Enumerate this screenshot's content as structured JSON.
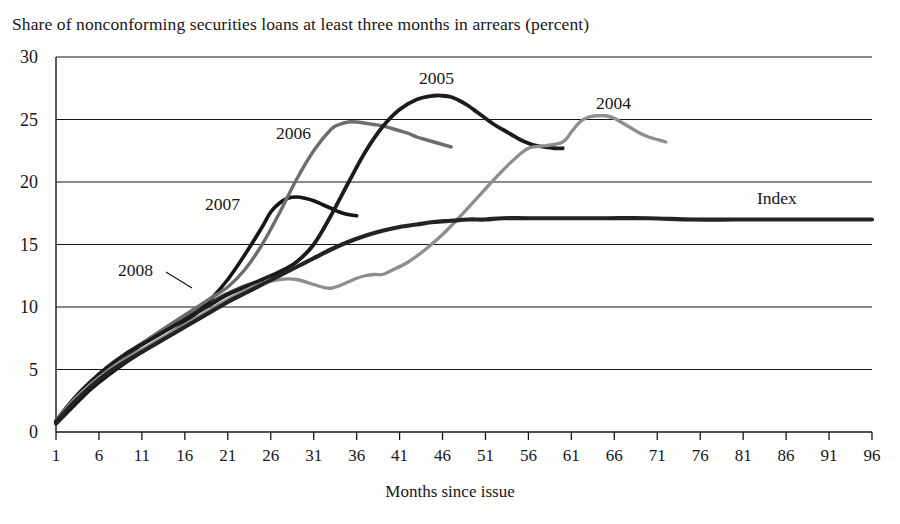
{
  "chart_data": {
    "type": "line",
    "title": "Share of nonconforming securities loans at least three months in arrears (percent)",
    "xlabel": "Months since issue",
    "ylabel": "",
    "xlim": [
      1,
      96
    ],
    "ylim": [
      0,
      30
    ],
    "yticks": [
      0,
      5,
      10,
      15,
      20,
      25,
      30
    ],
    "xticks": [
      1,
      6,
      11,
      16,
      21,
      26,
      31,
      36,
      41,
      46,
      51,
      56,
      61,
      66,
      71,
      76,
      81,
      86,
      91,
      96
    ],
    "grid": "horizontal",
    "legend": "inline-labels",
    "series": [
      {
        "name": "2008",
        "label": "2008",
        "color": "#4a4a4a",
        "width": 3.2,
        "label_x": 118,
        "label_y": 262,
        "leader": {
          "x1": 166,
          "y1": 272,
          "x2": 192,
          "y2": 288
        },
        "x": [
          1,
          3,
          5,
          7,
          9,
          11,
          13,
          15,
          17,
          19,
          21,
          23,
          25
        ],
        "y": [
          0.6,
          2.0,
          3.4,
          4.7,
          5.9,
          7.0,
          8.0,
          8.9,
          9.7,
          10.4,
          11.1,
          11.7,
          12.1
        ]
      },
      {
        "name": "2007",
        "label": "2007",
        "color": "#151515",
        "width": 3.6,
        "label_x": 205,
        "label_y": 196,
        "x": [
          1,
          3,
          5,
          7,
          9,
          11,
          13,
          15,
          17,
          19,
          21,
          23,
          25,
          26,
          27,
          28,
          29,
          30,
          31,
          32,
          33,
          34,
          35,
          36
        ],
        "y": [
          0.7,
          2.1,
          3.4,
          4.5,
          5.5,
          6.4,
          7.3,
          8.2,
          9.3,
          10.6,
          12.2,
          14.2,
          16.4,
          17.6,
          18.3,
          18.7,
          18.8,
          18.7,
          18.5,
          18.2,
          17.9,
          17.6,
          17.4,
          17.3
        ]
      },
      {
        "name": "2006",
        "label": "2006",
        "color": "#6d6d6d",
        "width": 3.4,
        "label_x": 276,
        "label_y": 125,
        "x": [
          1,
          3,
          5,
          7,
          9,
          11,
          13,
          15,
          17,
          19,
          21,
          23,
          25,
          27,
          29,
          31,
          33,
          34,
          35,
          36,
          37,
          38,
          39,
          40,
          41,
          42,
          43,
          44,
          45,
          46,
          47
        ],
        "y": [
          0.8,
          2.4,
          3.9,
          5.1,
          6.2,
          7.1,
          8.0,
          8.9,
          9.8,
          10.7,
          11.6,
          13.0,
          15.0,
          17.5,
          20.2,
          22.5,
          24.2,
          24.6,
          24.8,
          24.8,
          24.7,
          24.6,
          24.5,
          24.3,
          24.1,
          23.9,
          23.6,
          23.4,
          23.2,
          23.0,
          22.8
        ]
      },
      {
        "name": "2005",
        "label": "2005",
        "color": "#1c1c1c",
        "width": 3.8,
        "label_x": 419,
        "label_y": 70,
        "x": [
          1,
          3,
          5,
          7,
          9,
          11,
          13,
          15,
          17,
          19,
          21,
          23,
          25,
          27,
          29,
          31,
          33,
          35,
          37,
          39,
          41,
          43,
          45,
          46,
          47,
          48,
          49,
          50,
          51,
          52,
          53,
          54,
          55,
          56,
          57,
          58,
          59,
          60
        ],
        "y": [
          0.9,
          2.6,
          4.0,
          5.2,
          6.2,
          7.0,
          7.8,
          8.6,
          9.4,
          10.2,
          11.0,
          11.6,
          12.2,
          12.8,
          13.6,
          15.0,
          17.3,
          19.9,
          22.4,
          24.4,
          25.8,
          26.6,
          26.9,
          26.9,
          26.8,
          26.5,
          26.1,
          25.6,
          25.1,
          24.6,
          24.2,
          23.8,
          23.4,
          23.1,
          22.9,
          22.8,
          22.7,
          22.7
        ]
      },
      {
        "name": "2004",
        "label": "2004",
        "color": "#8e8e8e",
        "width": 3.3,
        "label_x": 596,
        "label_y": 95,
        "x": [
          1,
          3,
          5,
          7,
          9,
          11,
          13,
          15,
          17,
          19,
          21,
          23,
          25,
          27,
          29,
          31,
          32,
          33,
          34,
          35,
          36,
          37,
          38,
          39,
          40,
          42,
          44,
          46,
          48,
          50,
          52,
          54,
          56,
          58,
          60,
          61,
          62,
          63,
          64,
          65,
          66,
          67,
          68,
          69,
          70,
          71,
          72
        ],
        "y": [
          0.9,
          2.5,
          3.8,
          4.9,
          5.8,
          6.6,
          7.4,
          8.2,
          9.0,
          9.8,
          10.6,
          11.3,
          11.9,
          12.2,
          12.2,
          11.8,
          11.6,
          11.5,
          11.7,
          12.0,
          12.3,
          12.5,
          12.6,
          12.6,
          12.9,
          13.6,
          14.6,
          15.8,
          17.2,
          18.7,
          20.2,
          21.6,
          22.7,
          22.9,
          23.2,
          24.0,
          24.8,
          25.2,
          25.3,
          25.3,
          25.1,
          24.7,
          24.3,
          23.9,
          23.6,
          23.4,
          23.2
        ]
      },
      {
        "name": "Index",
        "label": "Index",
        "color": "#232323",
        "width": 4.2,
        "label_x": 757,
        "label_y": 190,
        "x": [
          1,
          3,
          5,
          7,
          9,
          11,
          13,
          15,
          17,
          19,
          21,
          23,
          25,
          27,
          29,
          31,
          33,
          35,
          37,
          39,
          41,
          43,
          45,
          47,
          49,
          51,
          53,
          56,
          60,
          65,
          70,
          75,
          80,
          85,
          90,
          96
        ],
        "y": [
          0.8,
          2.3,
          3.6,
          4.7,
          5.6,
          6.4,
          7.2,
          8.0,
          8.8,
          9.6,
          10.4,
          11.1,
          11.8,
          12.5,
          13.2,
          13.9,
          14.6,
          15.2,
          15.7,
          16.1,
          16.4,
          16.6,
          16.8,
          16.9,
          17.0,
          17.0,
          17.1,
          17.1,
          17.1,
          17.1,
          17.1,
          17.0,
          17.0,
          17.0,
          17.0,
          17.0
        ]
      }
    ]
  },
  "axes": {
    "ytick_labels": [
      "30",
      "25",
      "20",
      "15",
      "10",
      "5",
      "0"
    ],
    "xtick_labels": [
      "1",
      "6",
      "11",
      "16",
      "21",
      "26",
      "31",
      "36",
      "41",
      "46",
      "51",
      "56",
      "61",
      "66",
      "71",
      "76",
      "81",
      "86",
      "91",
      "96"
    ]
  }
}
